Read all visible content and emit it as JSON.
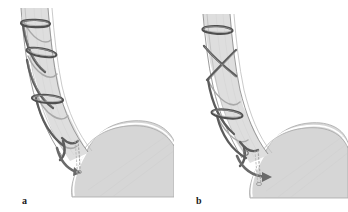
{
  "figure": {
    "type": "medical-illustration",
    "background_color": "#ffffff",
    "panel_count": 2
  },
  "colors": {
    "background": "#ffffff",
    "organ_fill": "#d6d6d6",
    "organ_fill_light": "#e2e2e2",
    "organ_outline": "#9a9a9a",
    "organ_highlight": "#ffffff",
    "band_dark": "#555555",
    "band_mid": "#6f6f6f",
    "band_light": "#8d8d8d",
    "suture": "#9e9e9e",
    "label_text": "#1a1a1a"
  },
  "panels": [
    {
      "id": "a",
      "label": "a",
      "description": "Spiral band wound helically along the esophagus with three transverse rings; distal end curves into the gastric cardia with a vertical dotted suture thread.",
      "structures": {
        "esophagus": "tubular organ descending from top, curving right at the distal end",
        "stomach": "rounded fundus and body filling the lower right region",
        "ge_junction": "notch where the esophagus meets the stomach",
        "rings": 3,
        "helix_turns": 3,
        "arrow": "curved arrow directed downward into the gastric cardia",
        "suture": "vertical dotted thread descending into the stomach"
      }
    },
    {
      "id": "b",
      "label": "b",
      "description": "Band crossed in an X configuration in the proximal esophagus with a single mid ring; distal tip deployed with an arrow advancing into the stomach lumen.",
      "structures": {
        "esophagus": "tubular organ descending from top, curving right at the distal end",
        "stomach": "rounded fundus and body filling the lower right region",
        "ge_junction": "notch where the esophagus meets the stomach",
        "rings": 2,
        "helix_turns": 2,
        "crossing": "X-shaped crossing of the band in the upper esophagus",
        "arrow": "arrow with solid head advancing rightward into the stomach",
        "suture": "dotted thread descending through the junction"
      }
    }
  ]
}
